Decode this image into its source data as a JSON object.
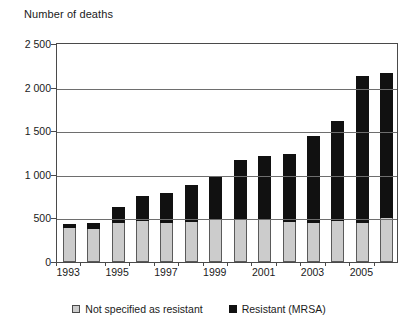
{
  "chart_data": {
    "type": "bar",
    "subtype": "stacked-vertical",
    "title": "Number of deaths",
    "xlabel": "",
    "ylabel": "",
    "ylim": [
      0,
      2500
    ],
    "ytick_values": [
      0,
      500,
      1000,
      1500,
      2000,
      2500
    ],
    "ytick_labels": [
      "0",
      "500",
      "1 000",
      "1 500",
      "2 000",
      "2 500"
    ],
    "grid": true,
    "legend_position": "bottom",
    "categories": [
      1993,
      1994,
      1995,
      1996,
      1997,
      1998,
      1999,
      2000,
      2001,
      2002,
      2003,
      2004,
      2005,
      2006
    ],
    "xtick_labels": [
      "1993",
      "1995",
      "1997",
      "1999",
      "2001",
      "2003",
      "2005"
    ],
    "xtick_categories": [
      1993,
      1995,
      1997,
      1999,
      2001,
      2003,
      2005
    ],
    "series": [
      {
        "name": "Not specified as resistant",
        "color": "#cccccc",
        "values": [
          390,
          380,
          450,
          470,
          450,
          460,
          480,
          480,
          480,
          460,
          450,
          470,
          450,
          500
        ]
      },
      {
        "name": "Resistant (MRSA)",
        "color": "#111111",
        "values": [
          50,
          70,
          180,
          290,
          340,
          420,
          500,
          690,
          740,
          780,
          990,
          1150,
          1680,
          1670
        ]
      }
    ],
    "totals": [
      440,
      450,
      630,
      760,
      790,
      880,
      980,
      1170,
      1220,
      1240,
      1440,
      1620,
      2130,
      2170
    ]
  },
  "legend": {
    "items": [
      {
        "label": "Not specified as resistant",
        "swatch": "gray-square-icon"
      },
      {
        "label": "Resistant (MRSA)",
        "swatch": "black-square-icon"
      }
    ]
  }
}
